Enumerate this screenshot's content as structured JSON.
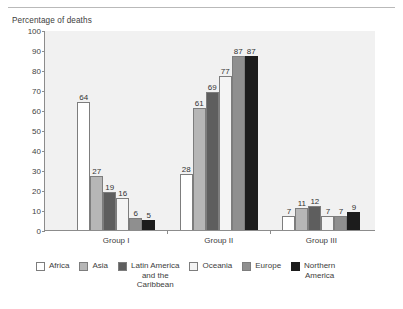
{
  "axis_title": "Percentage of deaths",
  "chart_data": {
    "type": "bar",
    "title": "",
    "ylabel": "Percentage of deaths",
    "xlabel": "",
    "ylim": [
      0,
      100
    ],
    "yticks": [
      100,
      90,
      80,
      70,
      60,
      50,
      40,
      30,
      20,
      10,
      0
    ],
    "grid": false,
    "legend_position": "bottom",
    "categories": [
      "Group I",
      "Group II",
      "Group III"
    ],
    "series": [
      {
        "name": "Africa",
        "color": "#ffffff",
        "values": [
          64,
          28,
          7
        ]
      },
      {
        "name": "Asia",
        "color": "#b6b6b6",
        "values": [
          27,
          61,
          11
        ]
      },
      {
        "name": "Latin America and the Caribbean",
        "color": "#5e5e5e",
        "values": [
          19,
          69,
          12
        ]
      },
      {
        "name": "Oceania",
        "color": "#f4f4f4",
        "values": [
          16,
          77,
          7
        ]
      },
      {
        "name": "Europe",
        "color": "#8f8f8f",
        "values": [
          6,
          87,
          7
        ]
      },
      {
        "name": "Northern America",
        "color": "#1c1c1c",
        "values": [
          5,
          87,
          9
        ]
      }
    ]
  },
  "legend": [
    {
      "label": "Africa",
      "lines": [
        "Africa"
      ]
    },
    {
      "label": "Asia",
      "lines": [
        "Asia"
      ]
    },
    {
      "label": "Latin America and the Caribbean",
      "lines": [
        "Latin America",
        "and the",
        "Caribbean"
      ]
    },
    {
      "label": "Oceania",
      "lines": [
        "Oceania"
      ]
    },
    {
      "label": "Europe",
      "lines": [
        "Europe"
      ]
    },
    {
      "label": "Northern America",
      "lines": [
        "Northern",
        "America"
      ]
    }
  ]
}
